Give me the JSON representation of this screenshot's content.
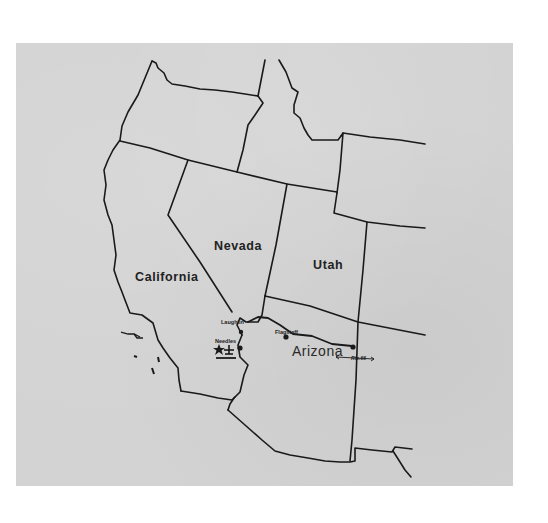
{
  "map": {
    "title": "Western United States route map",
    "background_color": "#d3d3d3",
    "line_color": "#1a1a1a",
    "states": [
      {
        "name": "California"
      },
      {
        "name": "Nevada"
      },
      {
        "name": "Utah"
      },
      {
        "name": "Arizona"
      }
    ],
    "cities": [
      {
        "name": "Laughlin"
      },
      {
        "name": "Needles"
      },
      {
        "name": "Flagstaff"
      }
    ],
    "route": {
      "label": "Rte.66"
    },
    "markers": [
      {
        "type": "star-icon"
      },
      {
        "type": "airport-icon"
      }
    ]
  }
}
